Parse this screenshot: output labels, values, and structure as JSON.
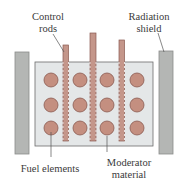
{
  "diagram": {
    "type": "nuclear-reactor-schematic",
    "labels": {
      "control_rods_line1": "Control",
      "control_rods_line2": "rods",
      "radiation_shield_line1": "Radiation",
      "radiation_shield_line2": "shield",
      "fuel_elements": "Fuel elements",
      "moderator_line1": "Moderator",
      "moderator_line2": "material"
    },
    "colors": {
      "shield_fill": "#b4b6b4",
      "shield_stroke": "#8a8c8a",
      "moderator_fill": "#e4e7e8",
      "moderator_stroke": "#6c6c6c",
      "rod_fill": "#c4968a",
      "rod_stroke": "#8a5a50",
      "fuel_fill": "#c48f80",
      "fuel_stroke": "#8a5a50",
      "leader_line": "#555555"
    },
    "fuel_grid": {
      "rows": 3,
      "columns": 4,
      "count": 12
    },
    "control_rod_count": 3,
    "shield_count": 2
  }
}
